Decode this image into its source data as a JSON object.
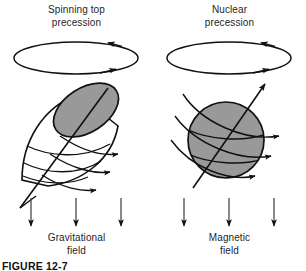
{
  "figure": {
    "caption": "FIGURE 12-7",
    "background_color": "#ffffff",
    "stroke_color": "#111111",
    "body_fill_color": "#999999"
  },
  "panels": [
    {
      "id": "spinning-top",
      "title": "Spinning top\nprecession",
      "title_line1": "Spinning top",
      "title_line2": "precession",
      "field_label": "Gravitational\nfield",
      "field_line1": "Gravitational",
      "field_line2": "field",
      "body_shape": "spinning-top",
      "precession_arrows": 2,
      "spin_arrows": 3,
      "field_arrows": 3,
      "field_direction": "down"
    },
    {
      "id": "nuclear",
      "title": "Nuclear\nprecession",
      "title_line1": "Nuclear",
      "title_line2": "precession",
      "field_label": "Magnetic\nfield",
      "field_line1": "Magnetic",
      "field_line2": "field",
      "body_shape": "sphere",
      "precession_arrows": 2,
      "spin_arrows": 3,
      "field_arrows": 3,
      "field_direction": "down"
    }
  ]
}
